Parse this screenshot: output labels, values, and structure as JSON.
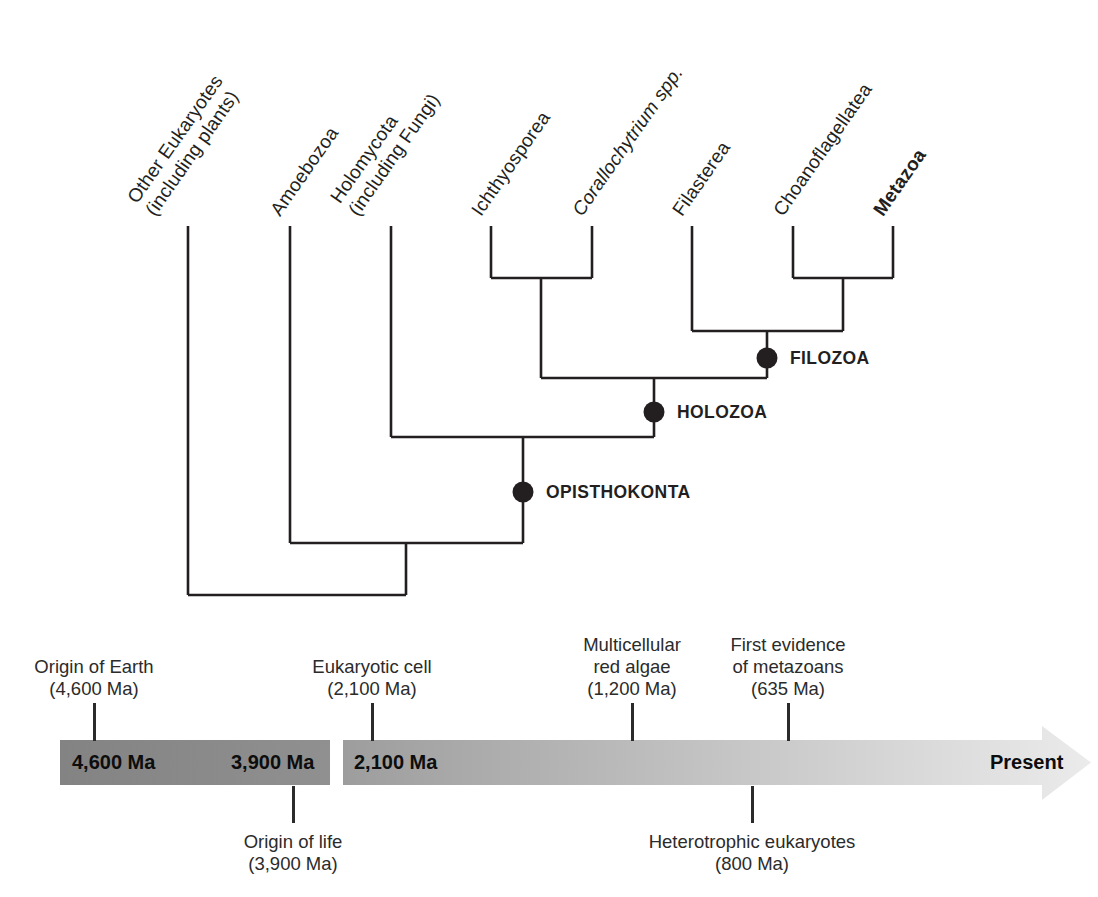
{
  "figure": {
    "type": "phylogenetic-tree-with-timeline",
    "background_color": "#ffffff",
    "line_color": "#231f20"
  },
  "tree": {
    "taxa": [
      {
        "lines": [
          "Other Eukaryotes",
          "(including plants)"
        ],
        "style": "normal"
      },
      {
        "lines": [
          "Amoebozoa"
        ],
        "style": "normal"
      },
      {
        "lines": [
          "Holomycota",
          "(including Fungi)"
        ],
        "style": "normal"
      },
      {
        "lines": [
          "Ichthyosporea"
        ],
        "style": "normal"
      },
      {
        "lines": [
          "Corallochytrium spp."
        ],
        "style": "italic"
      },
      {
        "lines": [
          "Filasterea"
        ],
        "style": "normal"
      },
      {
        "lines": [
          "Choanoflagellatea"
        ],
        "style": "normal"
      },
      {
        "lines": [
          "Metazoa"
        ],
        "style": "bold"
      }
    ],
    "clades": [
      {
        "label": "FILOZOA"
      },
      {
        "label": "HOLOZOA"
      },
      {
        "label": "OPISTHOKONTA"
      }
    ],
    "node_marker": "filled-black-circle"
  },
  "timeline": {
    "events_above": [
      {
        "lines": [
          "Origin of Earth",
          "(4,600 Ma)"
        ]
      },
      {
        "lines": [
          "Eukaryotic cell",
          "(2,100 Ma)"
        ]
      },
      {
        "lines": [
          "Multicellular",
          "red algae",
          "(1,200 Ma)"
        ]
      },
      {
        "lines": [
          "First evidence",
          "of metazoans",
          "(635 Ma)"
        ]
      }
    ],
    "events_below": [
      {
        "lines": [
          "Origin of life",
          "(3,900 Ma)"
        ]
      },
      {
        "lines": [
          "Heterotrophic eukaryotes",
          "(800 Ma)"
        ]
      }
    ],
    "bar_labels": {
      "seg1_left": "4,600 Ma",
      "seg1_right": "3,900 Ma",
      "seg2_left": "2,100 Ma",
      "end": "Present"
    },
    "colors": {
      "segment1_start": "#838383",
      "segment1_end": "#909090",
      "segment2_start": "#9d9d9d",
      "segment2_end": "#ebebeb"
    }
  }
}
